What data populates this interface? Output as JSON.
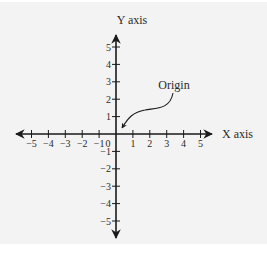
{
  "chart_data": {
    "type": "diagram",
    "title": "",
    "xlabel": "X axis",
    "ylabel": "Y axis",
    "x_ticks": [
      -5,
      -4,
      -3,
      -2,
      -1,
      1,
      2,
      3,
      4,
      5
    ],
    "x_tick_labels": [
      "−5",
      "−4",
      "−3",
      "−2",
      "−1",
      "1",
      "2",
      "3",
      "4",
      "5"
    ],
    "y_ticks": [
      5,
      4,
      3,
      2,
      1,
      -1,
      -2,
      -3,
      -4,
      -5
    ],
    "y_tick_labels": [
      "5",
      "4",
      "3",
      "2",
      "1",
      "−1",
      "−2",
      "−3",
      "−4",
      "−5"
    ],
    "origin_label": "0",
    "xlim": [
      -5,
      5
    ],
    "ylim": [
      -5,
      5
    ],
    "grid": false,
    "annotations": [
      {
        "text": "Origin",
        "points_to": [
          0,
          0
        ]
      }
    ]
  },
  "labels": {
    "x_axis": "X axis",
    "y_axis": "Y axis",
    "origin_zero": "0",
    "origin_callout": "Origin"
  },
  "colors": {
    "panel_bg": "#f3f3f3",
    "ink": "#1a1a1a"
  }
}
